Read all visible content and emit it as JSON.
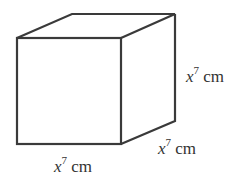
{
  "figure": {
    "shape": "cube",
    "edge_color": "#3a3a3a",
    "labels": {
      "height": {
        "var": "x",
        "exp": "7",
        "unit": " cm"
      },
      "depth": {
        "var": "x",
        "exp": "7",
        "unit": " cm"
      },
      "width": {
        "var": "x",
        "exp": "7",
        "unit": " cm"
      }
    }
  }
}
